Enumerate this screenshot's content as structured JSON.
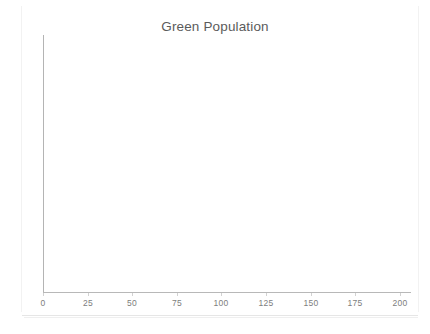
{
  "chart_data": {
    "type": "line",
    "title": "Green Population",
    "xlabel": "",
    "ylabel": "",
    "xlim": [
      0,
      200
    ],
    "x_ticks": [
      0,
      25,
      50,
      75,
      100,
      125,
      150,
      175,
      200
    ],
    "x_tick_labels": [
      "0",
      "25",
      "50",
      "75",
      "100",
      "125",
      "150",
      "175",
      "200"
    ],
    "y_ticks": [],
    "y_tick_labels": [],
    "grid": false,
    "legend": null,
    "series": [],
    "values": [],
    "categories": [],
    "annotations": [],
    "note_visible_content": "Plot area is empty — no data is drawn inside the axes."
  },
  "chart": {
    "title": "Green Population",
    "axis_color": "#b4b4b4",
    "title_color": "#5b5b5b",
    "tick_label_color": "#7d7d7d",
    "background_color": "#ffffff",
    "frame_color": "#e6e6e6"
  },
  "x_axis": {
    "ticks": [
      {
        "value": 0,
        "label": "0",
        "pos_px": 43
      },
      {
        "value": 25,
        "label": "25",
        "pos_px": 88
      },
      {
        "value": 50,
        "label": "50",
        "pos_px": 132
      },
      {
        "value": 75,
        "label": "75",
        "pos_px": 177
      },
      {
        "value": 100,
        "label": "100",
        "pos_px": 221
      },
      {
        "value": 125,
        "label": "125",
        "pos_px": 266
      },
      {
        "value": 150,
        "label": "150",
        "pos_px": 311
      },
      {
        "value": 175,
        "label": "175",
        "pos_px": 355
      },
      {
        "value": 200,
        "label": "200",
        "pos_px": 400
      }
    ]
  }
}
